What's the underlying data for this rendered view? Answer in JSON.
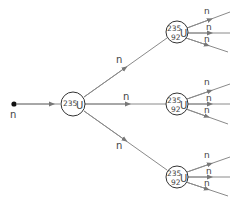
{
  "diagram": {
    "colors": {
      "line": "#8a8a8a",
      "circle": "#333333",
      "text": "#444444",
      "neutron": "#111111"
    },
    "incoming_neutron": {
      "label": "n"
    },
    "primary_nucleus": {
      "mass": "235",
      "symbol": "U"
    },
    "primary_branches": [
      {
        "label": "n"
      },
      {
        "label": "n"
      },
      {
        "label": "n"
      }
    ],
    "secondary_nuclei": [
      {
        "mass": "235",
        "atomic": "92",
        "symbol": "U",
        "outgoing": [
          "n",
          "n",
          "n"
        ]
      },
      {
        "mass": "235",
        "atomic": "92",
        "symbol": "U",
        "outgoing": [
          "n",
          "n",
          "n"
        ]
      },
      {
        "mass": "235",
        "atomic": "92",
        "symbol": "U",
        "outgoing": [
          "n",
          "n",
          "n"
        ]
      }
    ]
  }
}
